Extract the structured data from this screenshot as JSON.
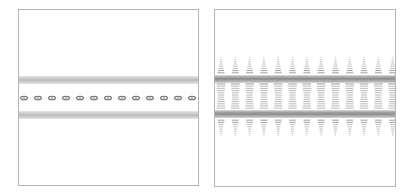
{
  "figure": {
    "panels": [
      {
        "id": "left",
        "description": "contour plot with two horizontal bands of parallel lines and a central row of small ellipses",
        "band_top_y_range": [
          67,
          74
        ],
        "band_bottom_y_range": [
          102,
          109
        ],
        "center_y": 88,
        "ellipse_count": 13,
        "ellipse_spacing": 14,
        "line_color": "#777777"
      },
      {
        "id": "right",
        "description": "contour plot with two dark horizontal bands and periodic columns of stacked contour dashes tapering above and below",
        "band_top_y": 69,
        "band_bottom_y": 104,
        "column_count": 13,
        "column_spacing": 14.3,
        "line_color": "#666666"
      }
    ]
  }
}
